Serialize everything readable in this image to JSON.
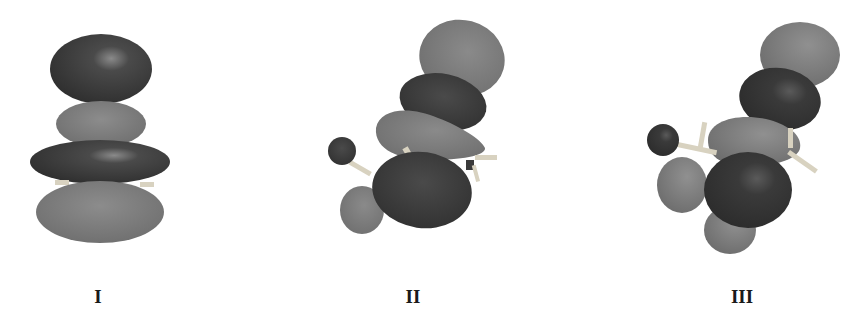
{
  "figure": {
    "panels": [
      {
        "id": "I",
        "label": "I"
      },
      {
        "id": "II",
        "label": "II"
      },
      {
        "id": "III",
        "label": "III"
      }
    ],
    "colors": {
      "dark_lobe": "#3d3d3d",
      "light_lobe": "#7a7a7a",
      "bond": "#d8d2c0",
      "background": "#ffffff"
    }
  }
}
